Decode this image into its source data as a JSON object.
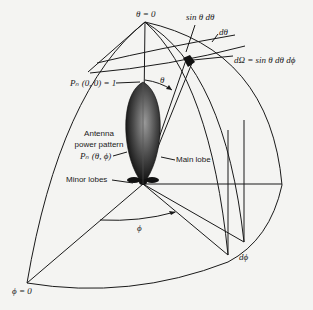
{
  "figure": {
    "type": "antenna radiation pattern on unit sphere octant",
    "colors": {
      "background": "#f4f4f2",
      "line": "#1a1a1a",
      "lobe_dark": "#111111",
      "lobe_light": "#8a8a8a"
    }
  },
  "labels": {
    "theta_zero": "θ = 0",
    "sin_theta_dtheta": "sin θ  dθ",
    "dtheta": "dθ",
    "solid_angle": "dΩ = sin θ dθ dϕ",
    "pn_max": "Pₙ (0, 0) = 1",
    "theta": "θ",
    "antenna_line1": "Antenna",
    "antenna_line2": "power pattern",
    "pn_theta_phi": "Pₙ (θ, ϕ)",
    "main_lobe": "Main lobe",
    "minor_lobes": "Minor lobes",
    "phi": "ϕ",
    "dphi": "dϕ",
    "phi_zero": "ϕ = 0"
  }
}
